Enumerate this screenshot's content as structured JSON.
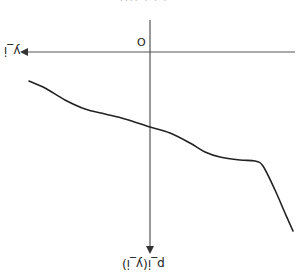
{
  "figure": {
    "cropped_header_text": "· · ·   ····",
    "origin_label": "O",
    "x_axis_label": "y_i",
    "y_axis_label": "p_i(y_i)",
    "labels_rotated_180": true,
    "colors": {
      "axis": "#555555",
      "curve": "#222222",
      "background": "#ffffff"
    },
    "axes": {
      "origin_px": [
        150,
        52
      ],
      "horizontal_axis": {
        "from_px": [
          295,
          52
        ],
        "to_px": [
          20,
          52
        ],
        "arrow": "left"
      },
      "vertical_axis": {
        "from_px": [
          150,
          20
        ],
        "to_px": [
          150,
          254
        ],
        "arrow": "down"
      }
    },
    "curve": {
      "description": "Decreasing wavy curve (density-like) drawn in a flipped coordinate frame",
      "points_px": [
        [
          29,
          81
        ],
        [
          45,
          88
        ],
        [
          65,
          100
        ],
        [
          85,
          109
        ],
        [
          105,
          114
        ],
        [
          125,
          119
        ],
        [
          150,
          127
        ],
        [
          170,
          133
        ],
        [
          190,
          143
        ],
        [
          205,
          152
        ],
        [
          220,
          157
        ],
        [
          240,
          160
        ],
        [
          255,
          161
        ],
        [
          263,
          166
        ],
        [
          275,
          190
        ],
        [
          285,
          213
        ],
        [
          293,
          231
        ]
      ]
    }
  }
}
